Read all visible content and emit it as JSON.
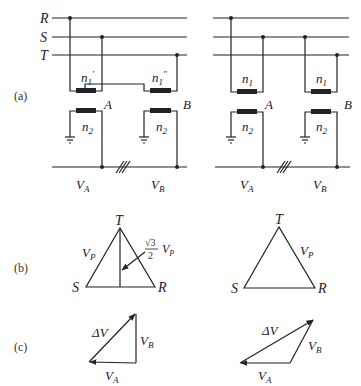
{
  "figure": {
    "panel_labels": {
      "a": "(a)",
      "b": "(b)",
      "c": "(c)"
    },
    "phases": {
      "r": "R",
      "s": "S",
      "t": "T"
    },
    "left_circuit": {
      "primary_a": "n",
      "primary_a_sub": "1",
      "primary_a_mark": "'",
      "primary_b": "n",
      "primary_b_sub": "1",
      "primary_b_mark": "\"",
      "secondary": "n",
      "secondary_sub": "2",
      "node_a": "A",
      "node_b": "B",
      "va": "V",
      "va_sub": "A",
      "vb": "V",
      "vb_sub": "B"
    },
    "right_circuit": {
      "primary": "n",
      "primary_sub": "1",
      "secondary": "n",
      "secondary_sub": "2",
      "node_a": "A",
      "node_b": "B",
      "va": "V",
      "va_sub": "A",
      "vb": "V",
      "vb_sub": "B"
    },
    "triangle_left": {
      "top": "T",
      "left": "S",
      "right": "R",
      "side": "V",
      "side_sub": "P",
      "height_num": "√3",
      "height_den": "2",
      "height_v": "V",
      "height_v_sub": "P"
    },
    "triangle_right": {
      "top": "T",
      "left": "S",
      "right": "R",
      "side": "V",
      "side_sub": "P"
    },
    "phasor_left": {
      "dv": "ΔV",
      "vb": "V",
      "vb_sub": "B",
      "va": "V",
      "va_sub": "A"
    },
    "phasor_right": {
      "dv": "ΔV",
      "vb": "V",
      "vb_sub": "B",
      "va": "V",
      "va_sub": "A"
    }
  }
}
